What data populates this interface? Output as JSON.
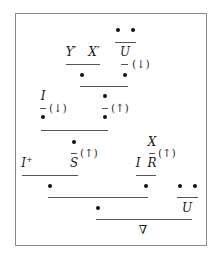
{
  "diagram": {
    "type": "proof-tree",
    "nodes": {
      "top_right_premise": "U",
      "top_left_premise_1": "Y′",
      "top_left_premise_2": "X′",
      "mid_left_premise": "I",
      "lower_s": "S",
      "lower_left": "I",
      "lower_left_sup": "+",
      "lower_right_x": "X",
      "lower_right_i": "I",
      "lower_right_r": "R",
      "bottom_right_u": "U",
      "conclusion": "∇"
    },
    "annotations": {
      "u_rule": "(↓)",
      "i_rule": "(↓)",
      "bullet_rule": "(↑)",
      "s_rule": "(↑)",
      "r_rule": "(↑)"
    },
    "markers": {
      "bullet": "•"
    }
  }
}
